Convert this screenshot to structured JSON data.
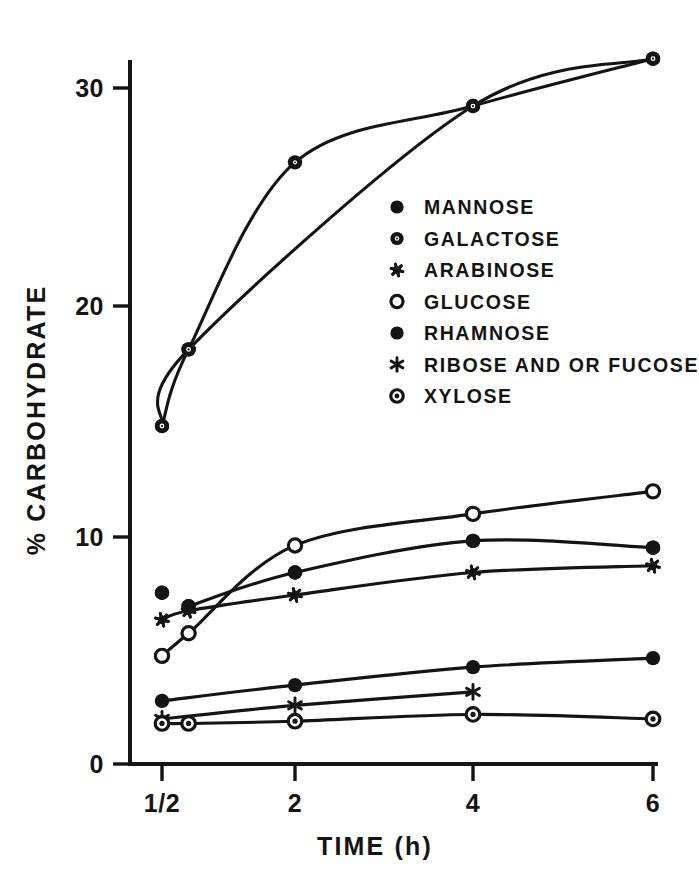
{
  "chart_data": {
    "type": "line",
    "title": "",
    "xlabel": "TIME (h)",
    "ylabel": "% CARBOHYDRATE",
    "grid": false,
    "legend_position": "inside-center-right",
    "x_tick_labels": [
      "1/2",
      "2",
      "4",
      "6"
    ],
    "x_tick_values": [
      0.5,
      2,
      4,
      6
    ],
    "y_tick_labels": [
      "0",
      "10",
      "20",
      "30"
    ],
    "y_tick_values": [
      0,
      10,
      20,
      30
    ],
    "ylim": [
      0,
      33.5
    ],
    "xlim": [
      0.5,
      6
    ],
    "series": [
      {
        "name": "MANNOSE",
        "marker": "filled-circle",
        "connected": false,
        "x": [
          0.5,
          0.8,
          2,
          4,
          6
        ],
        "values": [
          7.6,
          7.0,
          8.5,
          9.9,
          9.6
        ]
      },
      {
        "name": "GALACTOSE",
        "marker": "circle-hatched",
        "connected": true,
        "x": [
          0.5,
          0.8,
          2,
          4,
          6
        ],
        "values": [
          15.0,
          18.4,
          26.7,
          29.2,
          31.3
        ]
      },
      {
        "name": "ARABINOSE",
        "marker": "small-star",
        "connected": true,
        "x": [
          0.5,
          0.8,
          2,
          4,
          6
        ],
        "values": [
          6.4,
          6.8,
          7.5,
          8.5,
          8.8
        ]
      },
      {
        "name": "GLUCOSE",
        "marker": "open-circle",
        "connected": true,
        "x": [
          0.5,
          0.8,
          2,
          4,
          6
        ],
        "values": [
          4.8,
          5.8,
          9.7,
          11.1,
          12.1
        ]
      },
      {
        "name": "RHAMNOSE",
        "marker": "filled-circle",
        "connected": true,
        "x": [
          0.5,
          2,
          4,
          6
        ],
        "values": [
          2.8,
          3.5,
          4.3,
          4.7
        ]
      },
      {
        "name": "RIBOSE AND OR FUCOSE",
        "marker": "asterisk",
        "connected": true,
        "x": [
          0.5,
          2,
          4
        ],
        "values": [
          2.0,
          2.6,
          3.2
        ]
      },
      {
        "name": "XYLOSE",
        "marker": "circle-dot",
        "connected": true,
        "x": [
          0.5,
          0.8,
          2,
          4,
          6
        ],
        "values": [
          1.8,
          1.8,
          1.9,
          2.2,
          2.0
        ]
      }
    ]
  },
  "axes": {
    "y_title": "% CARBOHYDRATE",
    "x_title": "TIME (h)",
    "y_ticks": [
      {
        "label": "30",
        "value": 30
      },
      {
        "label": "20",
        "value": 20
      },
      {
        "label": "10",
        "value": 10
      },
      {
        "label": "0",
        "value": 0
      }
    ],
    "x_ticks": [
      {
        "label": "1/2",
        "value": 0.5
      },
      {
        "label": "2",
        "value": 2
      },
      {
        "label": "4",
        "value": 4
      },
      {
        "label": "6",
        "value": 6
      }
    ]
  },
  "legend": {
    "items": [
      {
        "label": "MANNOSE",
        "marker": "filled-circle"
      },
      {
        "label": "GALACTOSE",
        "marker": "circle-hatched"
      },
      {
        "label": "ARABINOSE",
        "marker": "small-star"
      },
      {
        "label": "GLUCOSE",
        "marker": "open-circle"
      },
      {
        "label": "RHAMNOSE",
        "marker": "filled-circle"
      },
      {
        "label": "RIBOSE AND OR FUCOSE",
        "marker": "asterisk"
      },
      {
        "label": "XYLOSE",
        "marker": "circle-dot"
      }
    ]
  },
  "colors": {
    "ink": "#141414",
    "background": "#ffffff"
  }
}
